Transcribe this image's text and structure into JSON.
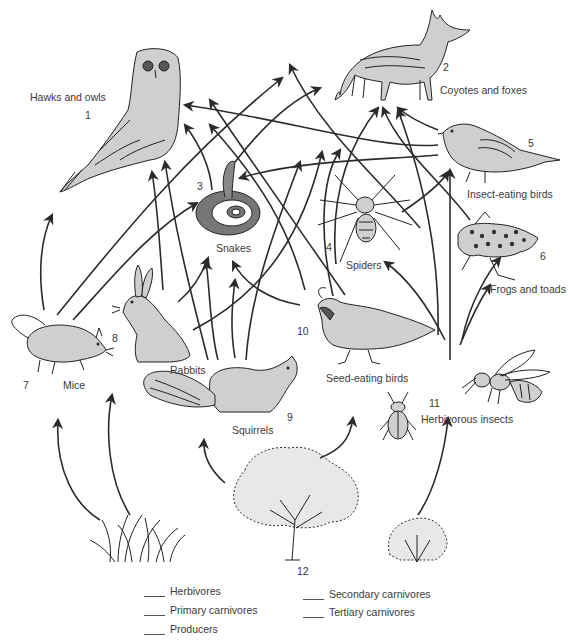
{
  "diagram": {
    "type": "food-web",
    "organisms": [
      {
        "id": 1,
        "number": "1",
        "label": "Hawks and owls"
      },
      {
        "id": 2,
        "number": "2",
        "label": "Coyotes and foxes"
      },
      {
        "id": 3,
        "number": "3",
        "label": "Snakes"
      },
      {
        "id": 4,
        "number": "4",
        "label": "Spiders"
      },
      {
        "id": 5,
        "number": "5",
        "label": "Insect-eating birds"
      },
      {
        "id": 6,
        "number": "6",
        "label": "Frogs and toads"
      },
      {
        "id": 7,
        "number": "7",
        "label": "Mice"
      },
      {
        "id": 8,
        "number": "8",
        "label": "Rabbits"
      },
      {
        "id": 9,
        "number": "9",
        "label": "Squirrels"
      },
      {
        "id": 10,
        "number": "10",
        "label": "Seed-eating birds"
      },
      {
        "id": 11,
        "number": "11",
        "label": "Herbivorous insects"
      },
      {
        "id": 12,
        "number": "12",
        "label": ""
      }
    ],
    "legend": [
      {
        "blank": "____",
        "label": "Herbivores"
      },
      {
        "blank": "____",
        "label": "Primary carnivores"
      },
      {
        "blank": "____",
        "label": "Producers"
      },
      {
        "blank": "____",
        "label": "Secondary carnivores"
      },
      {
        "blank": "____",
        "label": "Tertiary carnivores"
      }
    ],
    "arrow_color": "#2b2b2b",
    "background": "#ffffff"
  }
}
